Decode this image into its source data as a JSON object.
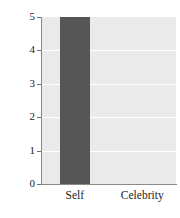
{
  "chart_data": {
    "type": "bar",
    "title": "",
    "xlabel": "",
    "ylabel": "Number of patients",
    "categories": [
      "Self",
      "Celebrity"
    ],
    "values": [
      5,
      0
    ],
    "series": [
      {
        "name": "Number of patients",
        "values": [
          5,
          0
        ]
      }
    ],
    "ylim": [
      0,
      5
    ],
    "yticks": [
      0,
      1,
      2,
      3,
      4,
      5
    ],
    "ytick_labels": [
      "0",
      "1",
      "2",
      "3",
      "4",
      "5"
    ],
    "grid": "horizontal",
    "legend": "none",
    "colors": {
      "bar": "#565656",
      "plot_background": "#eaeaea",
      "gridline": "#ffffff",
      "axis": "#8a8a8a",
      "text": "#1d1d1d",
      "page_background": "#ffffff"
    }
  }
}
